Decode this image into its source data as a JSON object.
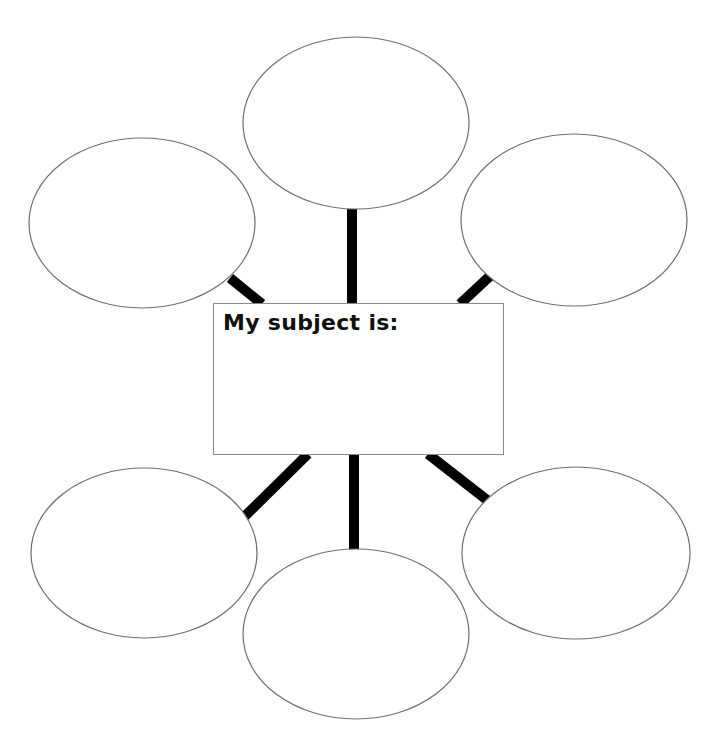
{
  "worksheet": {
    "title": "My subject is:",
    "subject_value": "",
    "colors": {
      "background": "#ffffff",
      "connector": "#000000",
      "bubble_outline": "#6e6e6e",
      "box_outline": "#8a8a8a",
      "text": "#111111"
    }
  },
  "bubbles": [
    {
      "id": "top",
      "cx": 356,
      "cy": 123,
      "rx": 113,
      "ry": 86,
      "value": ""
    },
    {
      "id": "upper-left",
      "cx": 142,
      "cy": 223,
      "rx": 113,
      "ry": 85,
      "value": ""
    },
    {
      "id": "upper-right",
      "cx": 574,
      "cy": 220,
      "rx": 113,
      "ry": 86,
      "value": ""
    },
    {
      "id": "lower-left",
      "cx": 144,
      "cy": 553,
      "rx": 113,
      "ry": 85,
      "value": ""
    },
    {
      "id": "bottom",
      "cx": 356,
      "cy": 634,
      "rx": 113,
      "ry": 85,
      "value": ""
    },
    {
      "id": "lower-right",
      "cx": 576,
      "cy": 553,
      "rx": 114,
      "ry": 86,
      "value": ""
    }
  ],
  "connectors": [
    {
      "id": "to-top",
      "x1": 352,
      "y1": 209,
      "x2": 352,
      "y2": 304
    },
    {
      "id": "to-upper-left",
      "x1": 230,
      "y1": 278,
      "x2": 262,
      "y2": 304
    },
    {
      "id": "to-upper-right",
      "x1": 490,
      "y1": 276,
      "x2": 460,
      "y2": 304
    },
    {
      "id": "to-lower-left",
      "x1": 243,
      "y1": 518,
      "x2": 308,
      "y2": 454
    },
    {
      "id": "to-bottom",
      "x1": 354,
      "y1": 454,
      "x2": 354,
      "y2": 550
    },
    {
      "id": "to-lower-right",
      "x1": 428,
      "y1": 454,
      "x2": 487,
      "y2": 500
    }
  ]
}
